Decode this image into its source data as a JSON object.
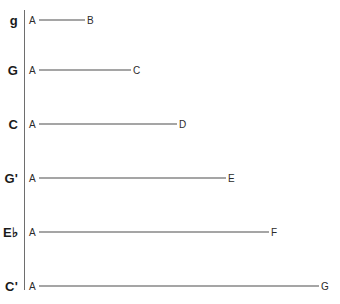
{
  "figure": {
    "background_color": "#ffffff",
    "axis_color": "#6e6e6e",
    "line_color": "#4d4d4d",
    "text_color": "#1a1a1a"
  },
  "axis": {
    "name": "fundamental-axis",
    "x": 24,
    "y_top": 10,
    "y_bottom": 290
  },
  "rows": [
    {
      "axis_label": "g",
      "start_label": "A",
      "end_label": "B",
      "y": 20,
      "line_start_x": 39,
      "line_end_x": 85,
      "start_label_x": 29,
      "end_label_x": 87
    },
    {
      "axis_label": "G",
      "start_label": "A",
      "end_label": "C",
      "y": 70,
      "line_start_x": 39,
      "line_end_x": 131,
      "start_label_x": 29,
      "end_label_x": 133
    },
    {
      "axis_label": "C",
      "start_label": "A",
      "end_label": "D",
      "y": 124,
      "line_start_x": 39,
      "line_end_x": 177,
      "start_label_x": 29,
      "end_label_x": 179
    },
    {
      "axis_label": "G'",
      "start_label": "A",
      "end_label": "E",
      "y": 178,
      "line_start_x": 39,
      "line_end_x": 226,
      "start_label_x": 29,
      "end_label_x": 228
    },
    {
      "axis_label": "E♭",
      "start_label": "A",
      "end_label": "F",
      "y": 232,
      "line_start_x": 39,
      "line_end_x": 269,
      "start_label_x": 29,
      "end_label_x": 271
    },
    {
      "axis_label": "C'",
      "start_label": "A",
      "end_label": "G",
      "y": 286,
      "line_start_x": 39,
      "line_end_x": 319,
      "start_label_x": 29,
      "end_label_x": 321
    }
  ],
  "chart_data": {
    "type": "bar",
    "orientation": "horizontal",
    "title": "",
    "xlabel": "",
    "ylabel": "",
    "categories": [
      "g",
      "G",
      "C",
      "G'",
      "E♭",
      "C'"
    ],
    "values": [
      46,
      92,
      138,
      187,
      230,
      280
    ],
    "bar_start_labels": [
      "A",
      "A",
      "A",
      "A",
      "A",
      "A"
    ],
    "bar_end_labels": [
      "B",
      "C",
      "D",
      "E",
      "F",
      "G"
    ],
    "xlim": [
      0,
      316
    ],
    "grid": false,
    "legend": "none"
  }
}
